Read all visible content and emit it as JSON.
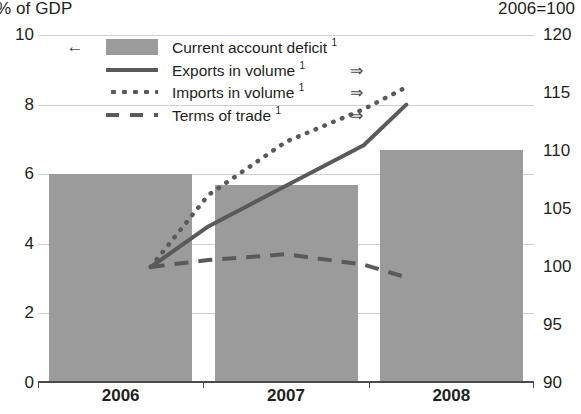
{
  "chart_data": {
    "type": "bar",
    "title": "",
    "subtitle": "",
    "categories": [
      "2006",
      "2007",
      "2008"
    ],
    "left_axis": {
      "label": "% of GDP",
      "ticks": [
        "0",
        "2",
        "4",
        "6",
        "8",
        "10"
      ],
      "min": 0,
      "max": 10
    },
    "right_axis": {
      "label": "2006=100",
      "ticks": [
        "90",
        "95",
        "100",
        "105",
        "110",
        "115",
        "120"
      ],
      "min": 90,
      "max": 120
    },
    "xlabel": "",
    "grid": true,
    "legend_position": "top-left",
    "series": [
      {
        "name": "Current account deficit ¹",
        "type": "bar",
        "axis": "left",
        "axis_arrow": "←",
        "color": "#9b9b9b",
        "categories": [
          "2006",
          "2007",
          "2008"
        ],
        "values": [
          6.0,
          5.7,
          6.7
        ]
      },
      {
        "name": "Exports in volume ¹",
        "type": "line",
        "style": "solid",
        "axis": "right",
        "axis_arrow": "⇒",
        "color": "#5a5a5a",
        "x": [
          "2006.5",
          "2007.0",
          "2007.5",
          "2008.0",
          "2008.5"
        ],
        "values": [
          100.0,
          103.5,
          107.0,
          110.5,
          114.0
        ]
      },
      {
        "name": "Imports in volume ¹",
        "type": "line",
        "style": "dotted",
        "axis": "right",
        "axis_arrow": "⇒",
        "color": "#5a5a5a",
        "x": [
          "2006.5",
          "2007.0",
          "2007.5",
          "2008.0",
          "2008.5"
        ],
        "values": [
          100.0,
          106.2,
          110.8,
          113.6,
          115.5
        ]
      },
      {
        "name": "Terms of trade ¹",
        "type": "line",
        "style": "dashed",
        "axis": "right",
        "axis_arrow": "⇒",
        "color": "#5a5a5a",
        "x": [
          "2006.5",
          "2007.0",
          "2007.5",
          "2008.0",
          "2008.5"
        ],
        "values": [
          100.0,
          100.6,
          101.1,
          100.2,
          99.1
        ]
      }
    ]
  },
  "legend": {
    "rows": [
      {
        "label": "Current account deficit ¹",
        "arrow_left": "←",
        "arrow_right": "",
        "swatch": "box"
      },
      {
        "label": "Exports in volume ¹",
        "arrow_left": "",
        "arrow_right": "⇒",
        "swatch": "solid"
      },
      {
        "label": "Imports in volume ¹",
        "arrow_left": "",
        "arrow_right": "⇒",
        "swatch": "dotted"
      },
      {
        "label": "Terms of trade ¹",
        "arrow_left": "",
        "arrow_right": "⇒",
        "swatch": "dashed"
      }
    ]
  },
  "colors": {
    "bar": "#9b9b9b",
    "line": "#5a5a5a",
    "grid": "#cfcfcf",
    "axis": "#4a4a4a",
    "text": "#231f20"
  }
}
